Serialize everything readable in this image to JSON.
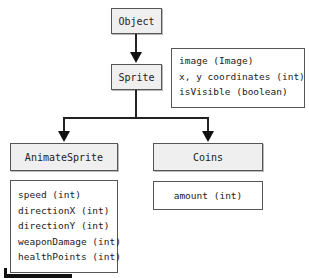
{
  "diagram": {
    "type": "class-hierarchy",
    "nodes": {
      "object": {
        "label": "Object"
      },
      "sprite": {
        "label": "Sprite",
        "attributes": [
          "image (Image)",
          "x, y coordinates (int)",
          "isVisible (boolean)"
        ]
      },
      "animate_sprite": {
        "label": "AnimateSprite",
        "attributes": [
          "speed (int)",
          "directionX (int)",
          "directionY (int)",
          "weaponDamage (int)",
          "healthPoints (int)"
        ]
      },
      "coins": {
        "label": "Coins",
        "attributes": [
          "amount (int)"
        ]
      }
    },
    "edges": [
      {
        "from": "Object",
        "to": "Sprite"
      },
      {
        "from": "Sprite",
        "to": "AnimateSprite"
      },
      {
        "from": "Sprite",
        "to": "Coins"
      }
    ]
  }
}
